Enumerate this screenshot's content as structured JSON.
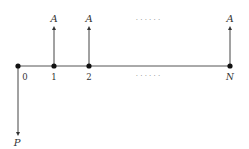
{
  "diagram": {
    "colors": {
      "line": "#444444",
      "node": "#111111",
      "text": "#333333",
      "dots": "#888888"
    },
    "timeline": {
      "periods": [
        {
          "label": "0",
          "x": 18
        },
        {
          "label": "1",
          "x": 54
        },
        {
          "label": "2",
          "x": 89
        },
        {
          "label": "N",
          "x": 230
        }
      ],
      "ellipsis_upper": "· · · · · ·",
      "ellipsis_lower": "· · · · · ·"
    },
    "inflows": [
      {
        "label": "A",
        "period": "1"
      },
      {
        "label": "A",
        "period": "2"
      },
      {
        "label": "A",
        "period": "N"
      }
    ],
    "outflow": {
      "label": "P",
      "period": "0"
    }
  }
}
